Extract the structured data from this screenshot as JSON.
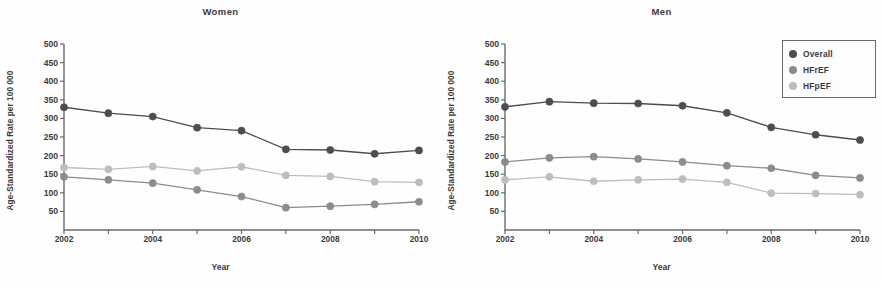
{
  "figure": {
    "axis_color": "#6a6a6a",
    "background": "#fefefe"
  },
  "legend": {
    "position": "top-right",
    "items": [
      {
        "label": "Overall",
        "color": "#4d4d4d",
        "icon": "circle-marker-icon"
      },
      {
        "label": "HFrEF",
        "color": "#8c8c8c",
        "icon": "circle-marker-icon"
      },
      {
        "label": "HFpEF",
        "color": "#bdbdbd",
        "icon": "circle-marker-icon"
      }
    ]
  },
  "chart_data": [
    {
      "type": "line",
      "title": "Women",
      "xlabel": "Year",
      "ylabel": "Age-Standardized Rate per 100 000",
      "x": [
        2002,
        2003,
        2004,
        2005,
        2006,
        2007,
        2008,
        2009,
        2010
      ],
      "xtick_labels": [
        "2002",
        "2004",
        "2006",
        "2008",
        "2010"
      ],
      "xticks": [
        2002,
        2004,
        2006,
        2008,
        2010
      ],
      "xlim": [
        2002,
        2010
      ],
      "ylim": [
        0,
        500
      ],
      "yticks": [
        50,
        100,
        150,
        200,
        250,
        300,
        350,
        400,
        450,
        500
      ],
      "ytick_labels": [
        "50",
        "100",
        "150",
        "200",
        "250",
        "300",
        "350",
        "400",
        "450",
        "500"
      ],
      "grid": false,
      "series": [
        {
          "name": "Overall",
          "color": "#4d4d4d",
          "values": [
            330,
            314,
            305,
            275,
            267,
            217,
            215,
            205,
            214
          ]
        },
        {
          "name": "HFpEF",
          "color": "#bdbdbd",
          "values": [
            168,
            163,
            171,
            159,
            170,
            147,
            144,
            130,
            128
          ]
        },
        {
          "name": "HFrEF",
          "color": "#8c8c8c",
          "values": [
            143,
            135,
            126,
            108,
            90,
            60,
            64,
            69,
            76
          ]
        }
      ]
    },
    {
      "type": "line",
      "title": "Men",
      "xlabel": "Year",
      "ylabel": "Age-Standardized Rate per 100 000",
      "x": [
        2002,
        2003,
        2004,
        2005,
        2006,
        2007,
        2008,
        2009,
        2010
      ],
      "xtick_labels": [
        "2002",
        "2004",
        "2006",
        "2008",
        "2010"
      ],
      "xticks": [
        2002,
        2004,
        2006,
        2008,
        2010
      ],
      "xlim": [
        2002,
        2010
      ],
      "ylim": [
        0,
        500
      ],
      "yticks": [
        50,
        100,
        150,
        200,
        250,
        300,
        350,
        400,
        450,
        500
      ],
      "ytick_labels": [
        "50",
        "100",
        "150",
        "200",
        "250",
        "300",
        "350",
        "400",
        "450",
        "500"
      ],
      "grid": false,
      "series": [
        {
          "name": "Overall",
          "color": "#4d4d4d",
          "values": [
            331,
            345,
            341,
            340,
            334,
            315,
            276,
            256,
            242
          ]
        },
        {
          "name": "HFrEF",
          "color": "#8c8c8c",
          "values": [
            183,
            194,
            197,
            191,
            183,
            173,
            166,
            147,
            140
          ]
        },
        {
          "name": "HFpEF",
          "color": "#bdbdbd",
          "values": [
            135,
            143,
            131,
            135,
            137,
            128,
            99,
            98,
            95
          ]
        }
      ]
    }
  ]
}
